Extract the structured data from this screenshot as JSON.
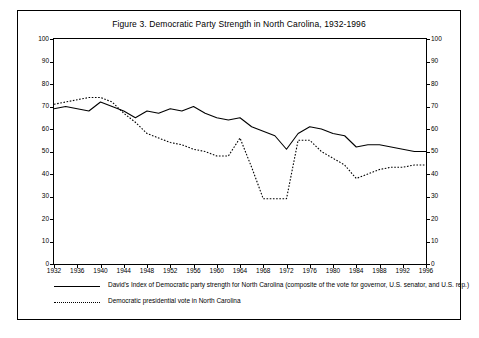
{
  "figure": {
    "title": "Figure 3.  Democratic Party Strength in North Carolina, 1932-1996"
  },
  "legend": {
    "items": [
      {
        "style": "solid",
        "label": "David's Index of Democratic party strength for North Carolina (composite of the vote for governor, U.S. senator, and U.S. rep.)"
      },
      {
        "style": "dotted",
        "label": "Democratic presidential vote in North Carolina"
      }
    ]
  },
  "chart_data": {
    "type": "line",
    "title": "Figure 3.  Democratic Party Strength in North Carolina, 1932-1996",
    "xlabel": "",
    "ylabel": "",
    "xlim": [
      1932,
      1996
    ],
    "ylim": [
      0,
      100
    ],
    "grid": false,
    "legend_position": "below",
    "xticks": [
      1932,
      1936,
      1940,
      1944,
      1948,
      1952,
      1956,
      1960,
      1964,
      1968,
      1972,
      1976,
      1980,
      1984,
      1988,
      1992,
      1996
    ],
    "yticks": [
      0,
      10,
      20,
      30,
      40,
      50,
      60,
      70,
      80,
      90,
      100
    ],
    "yticks_right": [
      0,
      10,
      20,
      30,
      40,
      50,
      60,
      70,
      80,
      90,
      100
    ],
    "x": [
      1932,
      1934,
      1936,
      1938,
      1940,
      1942,
      1944,
      1946,
      1948,
      1950,
      1952,
      1954,
      1956,
      1958,
      1960,
      1962,
      1964,
      1966,
      1968,
      1970,
      1972,
      1974,
      1976,
      1978,
      1980,
      1982,
      1984,
      1986,
      1988,
      1990,
      1992,
      1994,
      1996
    ],
    "series": [
      {
        "name": "David's Index of Democratic party strength for North Carolina (composite of the vote for governor, U.S. senator, and U.S. rep.)",
        "style": "solid",
        "values": [
          69,
          70,
          69,
          68,
          72,
          70,
          68,
          65,
          68,
          67,
          69,
          68,
          70,
          67,
          65,
          64,
          65,
          61,
          59,
          57,
          51,
          58,
          61,
          60,
          58,
          57,
          52,
          53,
          53,
          52,
          51,
          50,
          50
        ]
      },
      {
        "name": "Democratic presidential vote in North Carolina",
        "style": "dotted",
        "values": [
          71,
          72,
          73,
          74,
          74,
          72,
          67,
          63,
          58,
          56,
          54,
          53,
          51,
          50,
          48,
          48,
          56,
          43,
          29,
          29,
          29,
          55,
          55,
          50,
          47,
          44,
          38,
          40,
          42,
          43,
          43,
          44,
          44
        ]
      }
    ]
  }
}
